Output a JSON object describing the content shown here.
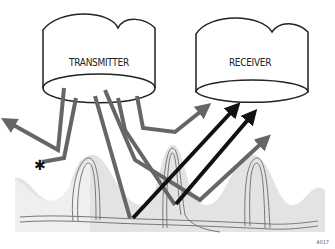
{
  "diagram": {
    "nodes": [
      {
        "id": "transmitter",
        "label": "TRANSMITTER"
      },
      {
        "id": "receiver",
        "label": "RECEIVER"
      }
    ],
    "figure_number": "4017",
    "colors": {
      "gray_path": "#666666",
      "black_path": "#111111",
      "tissue_light": "#ececec",
      "tissue_dark": "#dcdcdc"
    }
  }
}
